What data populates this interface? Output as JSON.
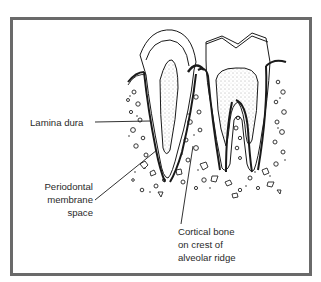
{
  "figure": {
    "labels": {
      "lamina_dura": "Lamina dura",
      "periodontal": [
        "Periodontal",
        "membrane",
        "space"
      ],
      "cortical": [
        "Cortical bone",
        "on crest of",
        "alveolar ridge"
      ]
    },
    "colors": {
      "frame": "#6a6a6a",
      "line": "#1a1a1a",
      "text": "#2a2a2a"
    }
  }
}
